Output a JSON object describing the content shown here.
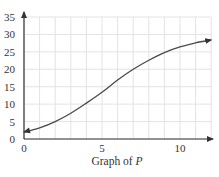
{
  "chart_data": {
    "type": "line",
    "title": "Graph of P",
    "title_parts": {
      "prefix": "Graph of ",
      "variable": "P"
    },
    "xlabel": "",
    "ylabel": "",
    "xlim": [
      0,
      12
    ],
    "ylim": [
      0,
      35
    ],
    "x_ticks": [
      0,
      5,
      10
    ],
    "y_ticks": [
      0,
      5,
      10,
      15,
      20,
      25,
      30,
      35
    ],
    "x_grid_step": 1,
    "y_grid_step": 5,
    "grid": true,
    "legend": null,
    "arrows": {
      "curve_start": true,
      "curve_end": true,
      "x_axis": true,
      "y_axis": true
    },
    "series": [
      {
        "name": "P",
        "x": [
          0,
          1,
          2,
          3,
          4,
          5,
          6,
          7,
          8,
          9,
          10,
          11,
          12
        ],
        "y": [
          2.0,
          3.2,
          5.0,
          7.4,
          10.3,
          13.4,
          16.9,
          20.0,
          22.6,
          24.8,
          26.4,
          27.6,
          28.4
        ]
      }
    ]
  },
  "colors": {
    "grid": "#e3e3e3",
    "axis": "#333333",
    "curve": "#4a4a4a",
    "text": "#333333",
    "background": "#ffffff"
  }
}
